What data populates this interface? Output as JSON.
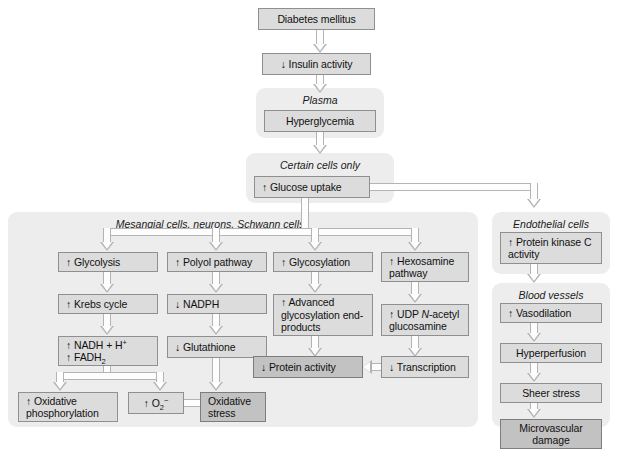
{
  "figure": {
    "caption": ""
  },
  "top_chain": {
    "disease": "Diabetes mellitus",
    "insulin": "↓ Insulin activity"
  },
  "panels": {
    "plasma": {
      "title": "Plasma",
      "boxes": {
        "hyperglycemia": "Hyperglycemia"
      }
    },
    "certain_cells": {
      "title": "Certain cells only",
      "boxes": {
        "glucose_uptake": "↑ Glucose uptake"
      }
    },
    "mesangial": {
      "title": "Mesangial cells, neurons, Schwann cells"
    },
    "endothelial": {
      "title": "Endothelial cells",
      "boxes": {
        "pkc": "↑ Protein kinase C activity"
      }
    },
    "blood_vessels": {
      "title": "Blood vessels",
      "boxes": {
        "vasodilation": "↑ Vasodilation",
        "hyperperfusion": "Hyperperfusion",
        "sheer_stress": "Sheer stress",
        "microvascular": "Microvascular damage"
      }
    }
  },
  "columns": {
    "glycolysis": {
      "c1": "↑ Glycolysis",
      "c2": "↑ Krebs cycle",
      "c3_line1": "↑ NADH + H",
      "c3_sup": "+",
      "c3_line2a": "↑ FADH",
      "c3_sub": "2",
      "c4": "↑ Oxidative phosphorylation"
    },
    "polyol": {
      "c1": "↑ Polyol pathway",
      "c2": "↓ NADPH",
      "c3": "↓ Glutathione"
    },
    "superoxide": {
      "box": "↑ O",
      "sub": "2",
      "sup": "−"
    },
    "oxidative_stress": {
      "box": "Oxidative stress"
    },
    "glycosylation": {
      "c1": "↑ Glycosylation",
      "c2": "↑ Advanced glycosylation end-products"
    },
    "hexosamine": {
      "c1": "↑ Hexosamine pathway",
      "c2_a": "↑ UDP ",
      "c2_ital": "N",
      "c2_b": "-acetyl glucosamine",
      "c3": "↓ Transcription"
    },
    "protein_activity": {
      "box": "↓ Protein activity"
    }
  },
  "colors": {
    "panel_bg": "#ededed",
    "box_bg": "#dcdcdc",
    "box_bg_dark": "#c2c2c2",
    "box_border": "#8f8f8f",
    "connector": "#b4b4b4",
    "text": "#111111",
    "page_bg": "#ffffff"
  }
}
